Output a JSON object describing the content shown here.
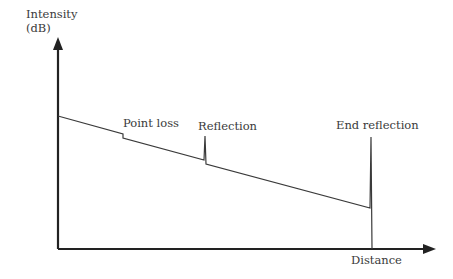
{
  "diagram": {
    "type": "OTDR trace",
    "y_axis_label_line1": "Intensity",
    "y_axis_label_line2": "(dB)",
    "x_axis_label": "Distance",
    "annotations": {
      "point_loss": "Point loss",
      "reflection": "Reflection",
      "end_reflection": "End reflection"
    },
    "colors": {
      "axis": "#222222",
      "trace": "#3a3a3a",
      "text": "#3a3a3a"
    }
  }
}
